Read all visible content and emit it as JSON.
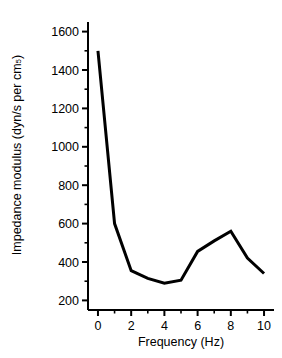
{
  "chart_data": {
    "type": "line",
    "title": "",
    "xlabel": "Frequency (Hz)",
    "ylabel_main": "Impedance modulus (dyn/s per cm",
    "ylabel_sup": "5",
    "ylabel_tail": ")",
    "ylabel_full": "Impedance modulus (dyn/s per cm⁵)",
    "xlim": [
      -0.6,
      10.6
    ],
    "ylim": [
      150,
      1650
    ],
    "xticks": [
      0,
      2,
      4,
      6,
      8,
      10
    ],
    "xticklabels": [
      "0",
      "2",
      "4",
      "6",
      "8",
      "10"
    ],
    "xminor": [
      1,
      3,
      5,
      7,
      9
    ],
    "yticks": [
      200,
      400,
      600,
      800,
      1000,
      1200,
      1400,
      1600
    ],
    "yticklabels": [
      "200",
      "400",
      "600",
      "800",
      "1000",
      "1200",
      "1400",
      "1600"
    ],
    "yminor": [
      300,
      500,
      700,
      900,
      1100,
      1300,
      1500
    ],
    "grid": false,
    "legend": false,
    "series": [
      {
        "name": "Impedance modulus",
        "color": "#000000",
        "linewidth": 3,
        "x": [
          0,
          1,
          2,
          3,
          4,
          5,
          6,
          7,
          8,
          9,
          10
        ],
        "values": [
          1500,
          600,
          355,
          315,
          290,
          305,
          455,
          510,
          560,
          420,
          340
        ]
      }
    ],
    "x": [
      0,
      1,
      2,
      3,
      4,
      5,
      6,
      7,
      8,
      9,
      10
    ],
    "values": [
      1500,
      600,
      355,
      315,
      290,
      305,
      455,
      510,
      560,
      420,
      340
    ]
  },
  "figure": {
    "background": "#ffffff",
    "axis_color": "#000000",
    "line_color": "#000000"
  }
}
